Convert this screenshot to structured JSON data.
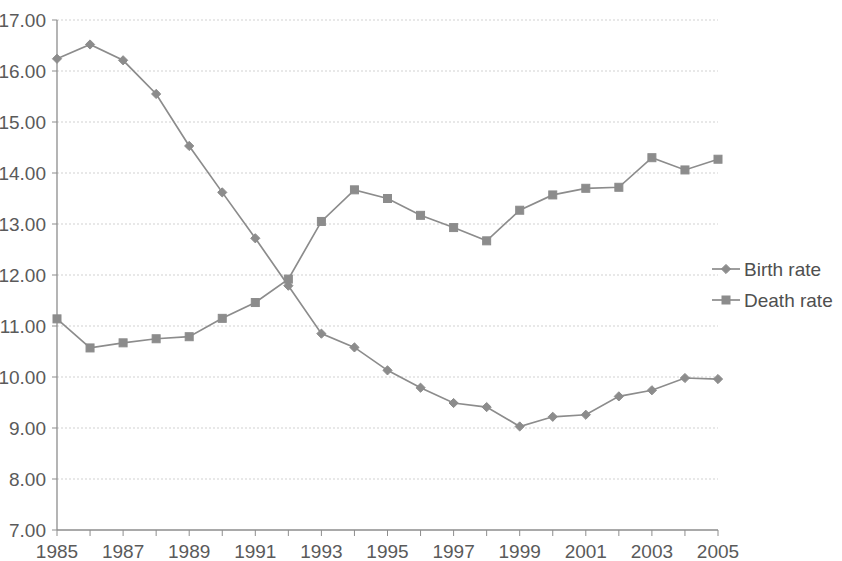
{
  "chart_data": {
    "type": "line",
    "title": "",
    "subtitle": "",
    "xlabel": "",
    "ylabel": "",
    "x": [
      1985,
      1986,
      1987,
      1988,
      1989,
      1990,
      1991,
      1992,
      1993,
      1994,
      1995,
      1996,
      1997,
      1998,
      1999,
      2000,
      2001,
      2002,
      2003,
      2004,
      2005
    ],
    "xlim": [
      1985,
      2005
    ],
    "ylim": [
      7.0,
      17.0
    ],
    "y_tick_step": 1.0,
    "x_tick_step": 1,
    "x_label_step": 2,
    "grid": true,
    "legend_position": "right",
    "series": [
      {
        "name": "Birth rate",
        "marker": "diamond",
        "color": "#8c8c8c",
        "values": [
          16.24,
          16.52,
          16.21,
          15.55,
          14.53,
          13.62,
          12.72,
          11.79,
          10.85,
          10.58,
          10.13,
          9.79,
          9.49,
          9.41,
          9.03,
          9.22,
          9.26,
          9.62,
          9.74,
          9.98,
          9.96
        ]
      },
      {
        "name": "Death rate",
        "marker": "square",
        "color": "#8c8c8c",
        "values": [
          11.14,
          10.57,
          10.67,
          10.75,
          10.79,
          11.15,
          11.46,
          11.92,
          13.05,
          13.67,
          13.5,
          13.17,
          12.93,
          12.67,
          13.27,
          13.57,
          13.7,
          13.72,
          14.3,
          14.06,
          14.27
        ]
      }
    ],
    "y_tick_labels": [
      "17.00",
      "16.00",
      "15.00",
      "14.00",
      "13.00",
      "12.00",
      "11.00",
      "10.00",
      "9.00",
      "8.00",
      "7.00"
    ],
    "y_tick_values": [
      17.0,
      16.0,
      15.0,
      14.0,
      13.0,
      12.0,
      11.0,
      10.0,
      9.0,
      8.0,
      7.0
    ],
    "x_tick_labels": [
      "1985",
      "1987",
      "1989",
      "1991",
      "1993",
      "1995",
      "1997",
      "1999",
      "2001",
      "2003",
      "2005"
    ],
    "x_tick_label_values": [
      1985,
      1987,
      1989,
      1991,
      1993,
      1995,
      1997,
      1999,
      2001,
      2003,
      2005
    ],
    "legend_entries": [
      "Birth rate",
      "Death rate"
    ]
  }
}
